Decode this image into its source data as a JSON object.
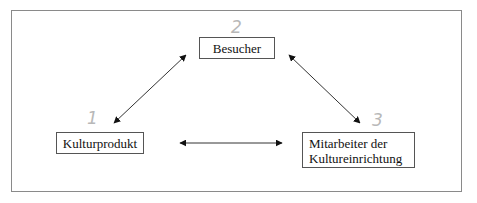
{
  "diagram": {
    "type": "triangle-relationship",
    "nodes": [
      {
        "id": "besucher",
        "label_lines": [
          "Besucher"
        ],
        "annotation": "2"
      },
      {
        "id": "kulturprodukt",
        "label_lines": [
          "Kulturprodukt"
        ],
        "annotation": "1"
      },
      {
        "id": "mitarbeiter",
        "label_lines": [
          "Mitarbeiter der",
          "Kultureinrichtung"
        ],
        "annotation": "3"
      }
    ],
    "edges": [
      {
        "from": "kulturprodukt",
        "to": "besucher",
        "direction": "bidirectional"
      },
      {
        "from": "besucher",
        "to": "mitarbeiter",
        "direction": "bidirectional"
      },
      {
        "from": "kulturprodukt",
        "to": "mitarbeiter",
        "direction": "bidirectional"
      }
    ],
    "colors": {
      "frame": "#8a8a8a",
      "box_border": "#555555",
      "arrow": "#222222",
      "handwriting": "#b8b8b8"
    }
  }
}
